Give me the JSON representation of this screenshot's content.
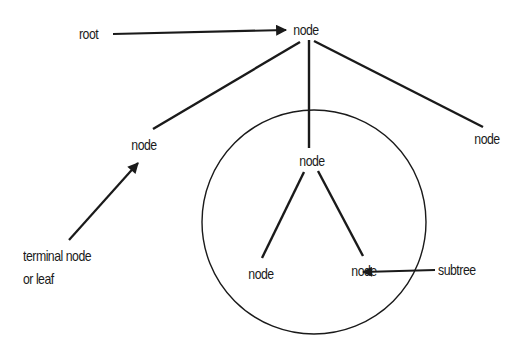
{
  "diagram": {
    "type": "tree-structure-illustration",
    "nodes": {
      "root": {
        "label": "node",
        "x": 306,
        "y": 22
      },
      "left": {
        "label": "node",
        "x": 144,
        "y": 137
      },
      "middle": {
        "label": "node",
        "x": 312,
        "y": 153
      },
      "right": {
        "label": "node",
        "x": 487,
        "y": 131
      },
      "subtree_left": {
        "label": "node",
        "x": 261,
        "y": 265
      },
      "subtree_right": {
        "label": "node",
        "x": 364,
        "y": 262
      }
    },
    "annotations": {
      "root_label": "root",
      "leaf_label_line1": "terminal node",
      "leaf_label_line2": "or leaf",
      "subtree_label": "subtree"
    },
    "edges": [
      {
        "from": "root",
        "to": "left"
      },
      {
        "from": "root",
        "to": "middle"
      },
      {
        "from": "root",
        "to": "right"
      },
      {
        "from": "middle",
        "to": "subtree_left"
      },
      {
        "from": "middle",
        "to": "subtree_right"
      }
    ],
    "subtree_circle": {
      "cx": 314,
      "cy": 222,
      "r": 112
    },
    "colors": {
      "ink": "#1a1a1a",
      "background": "#ffffff"
    }
  }
}
